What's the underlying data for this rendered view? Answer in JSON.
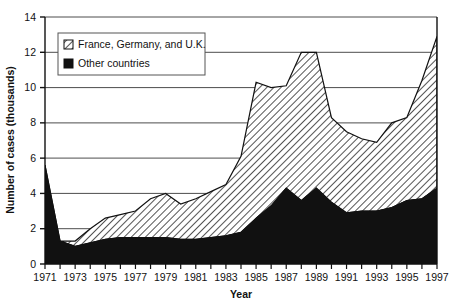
{
  "chart_data": {
    "type": "area",
    "stacked": true,
    "title": "",
    "xlabel": "Year",
    "ylabel": "Number of cases (thousands)",
    "xlim": [
      1971,
      1997
    ],
    "ylim": [
      0,
      14
    ],
    "yticks": [
      0,
      2,
      4,
      6,
      8,
      10,
      12,
      14
    ],
    "xticks": [
      1971,
      1973,
      1975,
      1977,
      1979,
      1981,
      1983,
      1985,
      1987,
      1989,
      1991,
      1993,
      1995,
      1997
    ],
    "xtick_labels": [
      "1971",
      "1973",
      "1975",
      "1977",
      "1979",
      "1981",
      "1983",
      "1985",
      "1987",
      "1989",
      "1991",
      "1993",
      "1995",
      "1997"
    ],
    "ytick_labels": [
      "0",
      "2",
      "4",
      "6",
      "8",
      "10",
      "12",
      "14"
    ],
    "grid": "horizontal",
    "legend_position": "upper-left-inside",
    "x": [
      1971,
      1972,
      1973,
      1974,
      1975,
      1976,
      1977,
      1978,
      1979,
      1980,
      1981,
      1982,
      1983,
      1984,
      1985,
      1986,
      1987,
      1988,
      1989,
      1990,
      1991,
      1992,
      1993,
      1994,
      1995,
      1996,
      1997
    ],
    "series": [
      {
        "name": "Other countries",
        "pattern": "solid-black",
        "color": "#111111",
        "values": [
          5.6,
          1.3,
          1.0,
          1.2,
          1.4,
          1.5,
          1.5,
          1.5,
          1.5,
          1.4,
          1.4,
          1.5,
          1.6,
          1.8,
          2.6,
          3.3,
          4.3,
          3.6,
          4.3,
          3.5,
          2.9,
          3.0,
          3.0,
          3.2,
          3.6,
          3.7,
          4.3
        ]
      },
      {
        "name": "France, Germany, and U.K.",
        "pattern": "diagonal-hatch",
        "color": "#ffffff",
        "values": [
          0.0,
          0.0,
          0.3,
          0.8,
          1.2,
          1.3,
          1.5,
          2.2,
          2.5,
          2.0,
          2.3,
          2.6,
          2.9,
          4.3,
          7.7,
          6.7,
          5.8,
          8.4,
          7.7,
          4.8,
          4.6,
          4.1,
          3.9,
          4.8,
          4.7,
          6.7,
          8.6
        ]
      }
    ],
    "totals": [
      5.6,
      1.3,
      1.3,
      2.0,
      2.6,
      2.8,
      3.0,
      3.7,
      4.0,
      3.4,
      3.7,
      4.1,
      4.5,
      6.1,
      10.3,
      10.0,
      10.1,
      12.0,
      12.0,
      8.3,
      7.5,
      7.1,
      6.9,
      8.0,
      8.3,
      10.4,
      12.9
    ],
    "legend": [
      {
        "label": "France, Germany, and U.K.",
        "swatch": "diagonal-hatch"
      },
      {
        "label": "Other countries",
        "swatch": "solid-black"
      }
    ]
  },
  "axis": {
    "x_title": "Year",
    "y_title": "Number of cases (thousands)"
  }
}
